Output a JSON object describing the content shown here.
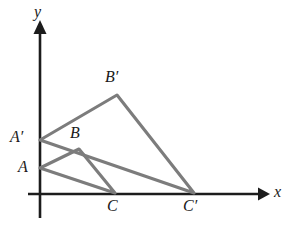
{
  "figure": {
    "background_color": "#ffffff",
    "width": 290,
    "height": 225
  },
  "axes": {
    "color": "#1c1c1c",
    "origin": {
      "x": 40,
      "y": 194
    },
    "x_axis": {
      "label": "x",
      "label_x": 274,
      "label_y": 190,
      "start_x": 28,
      "end_x": 262,
      "y": 194,
      "arrow_tip_x": 270
    },
    "y_axis": {
      "label": "y",
      "label_x": 34,
      "label_y": 4,
      "x": 40,
      "start_y": 218,
      "end_y": 30,
      "arrow_tip_y": 20
    }
  },
  "shapes": {
    "edge_color": "#7c7c7c",
    "triangles": [
      {
        "name": "triangle-abc",
        "vertices": [
          {
            "label": "A",
            "x": 40,
            "y": 168
          },
          {
            "label": "B",
            "x": 79,
            "y": 149
          },
          {
            "label": "C",
            "x": 115,
            "y": 193
          }
        ]
      },
      {
        "name": "triangle-a-prime-b-prime-c-prime",
        "vertices": [
          {
            "label": "A′",
            "x": 40,
            "y": 140
          },
          {
            "label": "B′",
            "x": 117,
            "y": 95
          },
          {
            "label": "C′",
            "x": 194,
            "y": 193
          }
        ]
      }
    ]
  },
  "labels": {
    "A": {
      "text": "A",
      "x": 18,
      "y": 160
    },
    "A_prime": {
      "text": "A′",
      "x": 11,
      "y": 130
    },
    "B": {
      "text": "B",
      "x": 72,
      "y": 126
    },
    "B_prime": {
      "text": "B′",
      "x": 106,
      "y": 70
    },
    "C": {
      "text": "C",
      "x": 108,
      "y": 199
    },
    "C_prime": {
      "text": "C′",
      "x": 184,
      "y": 199
    }
  }
}
